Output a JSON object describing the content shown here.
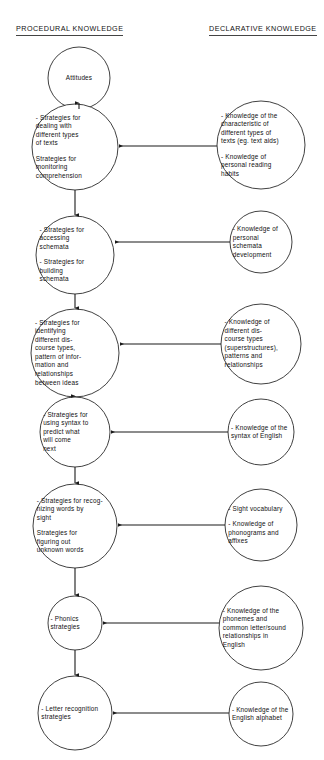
{
  "headings": {
    "procedural": "PROCEDURAL KNOWLEDGE",
    "declarative": "DECLARATIVE KNOWLEDGE"
  },
  "colors": {
    "stroke": "#2b2b2b",
    "connector": "#1a1a1a",
    "text": "#101010",
    "background": "#ffffff"
  },
  "procedural_nodes": [
    {
      "id": "attitudes",
      "lines": [
        "Attitudes"
      ],
      "cx": 79,
      "cy": 78,
      "r": 31
    },
    {
      "id": "strategies-texts",
      "lines": [
        "- Strategies for\ndealing with\ndifferent types\nof texts",
        "Strategies for\nmonitoring\ncomprehension"
      ],
      "cx": 75,
      "cy": 147,
      "r": 43
    },
    {
      "id": "strategies-schemata",
      "lines": [
        "- Strategies for\naccessing\nschemata",
        "- Strategies for\nbuilding\nschemata"
      ],
      "cx": 75,
      "cy": 255,
      "r": 39
    },
    {
      "id": "strategies-discourse",
      "lines": [
        "- Strategies for\nidentifying\ndifferent dis-\ncourse types,\npattern of infor-\nmation and\nrelationships\nbetween ideas"
      ],
      "cx": 75,
      "cy": 353,
      "r": 44
    },
    {
      "id": "strategies-syntax",
      "lines": [
        "- Strategies for\nusing syntax to\npredict what\nwill come\nnext"
      ],
      "cx": 75,
      "cy": 432,
      "r": 35
    },
    {
      "id": "strategies-words",
      "lines": [
        "- Strategies for recog-\nnizing words by\nsight",
        "Strategies for\nfiguring out\nunknown words"
      ],
      "cx": 75,
      "cy": 526,
      "r": 42
    },
    {
      "id": "phonics",
      "lines": [
        "- Phonics\nstrategies"
      ],
      "cx": 75,
      "cy": 623,
      "r": 27
    },
    {
      "id": "letter-recognition",
      "lines": [
        "- Letter recognition\nstrategies"
      ],
      "cx": 75,
      "cy": 713,
      "r": 37
    }
  ],
  "declarative_nodes": [
    {
      "id": "knowledge-text-characteristics",
      "lines": [
        "- Knowledge of the\ncharacteristic of\ndifferent types of\ntexts (eg. text aids)",
        "- Knowledge of\npersonal reading\nhabits"
      ],
      "cx": 261,
      "cy": 145,
      "r": 44
    },
    {
      "id": "knowledge-schemata",
      "lines": [
        "- Knowledge of\npersonal\nschemata\ndevelopment"
      ],
      "cx": 261,
      "cy": 242,
      "r": 31
    },
    {
      "id": "knowledge-discourse",
      "lines": [
        "- Knowledge of\ndifferent dis-\ncourse types\n(superstructures),\npatterns and\nrelationships"
      ],
      "cx": 261,
      "cy": 344,
      "r": 40
    },
    {
      "id": "knowledge-syntax",
      "lines": [
        "- Knowledge of the\nsyntax of English"
      ],
      "cx": 261,
      "cy": 432,
      "r": 33
    },
    {
      "id": "knowledge-vocabulary",
      "lines": [
        "- Sight vocabulary",
        "- Knowledge of\nphonograms and\naffixes"
      ],
      "cx": 261,
      "cy": 525,
      "r": 36
    },
    {
      "id": "knowledge-phonemes",
      "lines": [
        "- Knowledge of the\nphonemes and\ncommon letter/sound\nrelationships in\nEnglish"
      ],
      "cx": 261,
      "cy": 628,
      "r": 42
    },
    {
      "id": "knowledge-alphabet",
      "lines": [
        "- Knowledge of the\nEnglish alphabet"
      ],
      "cx": 261,
      "cy": 714,
      "r": 32
    }
  ],
  "vertical_flow": [
    {
      "id": "flow-attitudes-to-texts",
      "x": 79,
      "y1": 109,
      "y2": 103
    },
    {
      "id": "flow-texts-to-schemata",
      "x": 75,
      "y1": 190,
      "y2": 215
    },
    {
      "id": "flow-schemata-to-discourse",
      "x": 75,
      "y1": 294,
      "y2": 308
    },
    {
      "id": "flow-discourse-to-syntax",
      "x": 75,
      "y1": 397,
      "y2": 396
    },
    {
      "id": "flow-syntax-to-words",
      "x": 75,
      "y1": 467,
      "y2": 483
    },
    {
      "id": "flow-words-to-phonics",
      "x": 75,
      "y1": 568,
      "y2": 595
    },
    {
      "id": "flow-phonics-to-letter",
      "x": 75,
      "y1": 650,
      "y2": 675
    }
  ],
  "horizontal_flow": [
    {
      "id": "link-text-characteristics",
      "y": 146,
      "x1": 217,
      "x2": 119
    },
    {
      "id": "link-schemata",
      "y": 242,
      "x1": 230,
      "x2": 115
    },
    {
      "id": "link-discourse",
      "y": 344,
      "x1": 221,
      "x2": 120
    },
    {
      "id": "link-syntax",
      "y": 432,
      "x1": 228,
      "x2": 111
    },
    {
      "id": "link-vocabulary",
      "y": 525,
      "x1": 225,
      "x2": 118
    },
    {
      "id": "link-phonemes",
      "y": 623,
      "x1": 219,
      "x2": 103
    },
    {
      "id": "link-alphabet",
      "y": 713,
      "x1": 229,
      "x2": 113
    }
  ]
}
